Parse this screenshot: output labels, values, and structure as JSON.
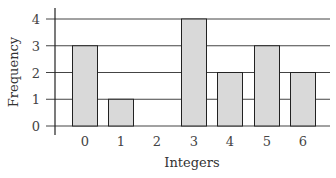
{
  "chart_data": {
    "type": "bar",
    "title": "",
    "xlabel": "Integers",
    "ylabel": "Frequency",
    "categories": [
      "0",
      "1",
      "2",
      "3",
      "4",
      "5",
      "6"
    ],
    "values": [
      3,
      1,
      0,
      4,
      2,
      3,
      2
    ],
    "yticks": [
      "0",
      "1",
      "2",
      "3",
      "4"
    ],
    "ylim": [
      0,
      4
    ],
    "grid": true,
    "legend": null,
    "colors": {
      "bar_fill": "#d9d9d9",
      "bar_stroke": "#222222",
      "grid": "#444444"
    }
  }
}
